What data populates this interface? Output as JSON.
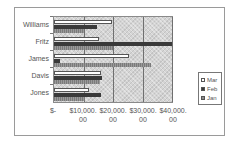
{
  "chart_data": {
    "type": "bar",
    "orientation": "horizontal",
    "title": "",
    "xlabel": "",
    "ylabel": "",
    "categories": [
      "Williams",
      "Fritz",
      "James",
      "Davis",
      "Jones"
    ],
    "series": [
      {
        "name": "Mar",
        "color": "#ffffff",
        "values": [
          19800,
          15300,
          25500,
          16000,
          12000
        ]
      },
      {
        "name": "Feb",
        "color": "#3a3a3a",
        "values": [
          14600,
          40000,
          2000,
          16200,
          15800
        ]
      },
      {
        "name": "Jan",
        "color": "#8c8c8c",
        "values": [
          10000,
          20000,
          33000,
          15500,
          10500
        ]
      }
    ],
    "xlim": [
      0,
      40000
    ],
    "xticks": [
      0,
      10000,
      20000,
      30000,
      40000
    ],
    "xtick_labels": [
      "$-",
      "$10,000.00",
      "$20,000.00",
      "$30,000.00",
      "$40,000.00"
    ],
    "grid": true,
    "legend_position": "right"
  },
  "axis": {
    "xtick_lines": [
      {
        "l1": "$-",
        "l2": ""
      },
      {
        "l1": "$10,000.",
        "l2": "00"
      },
      {
        "l1": "$20,000.",
        "l2": "00"
      },
      {
        "l1": "$30,000.",
        "l2": "00"
      },
      {
        "l1": "$40,000.",
        "l2": "00"
      }
    ]
  },
  "legend": {
    "items": [
      {
        "label": "Mar"
      },
      {
        "label": "Feb"
      },
      {
        "label": "Jan"
      }
    ]
  }
}
